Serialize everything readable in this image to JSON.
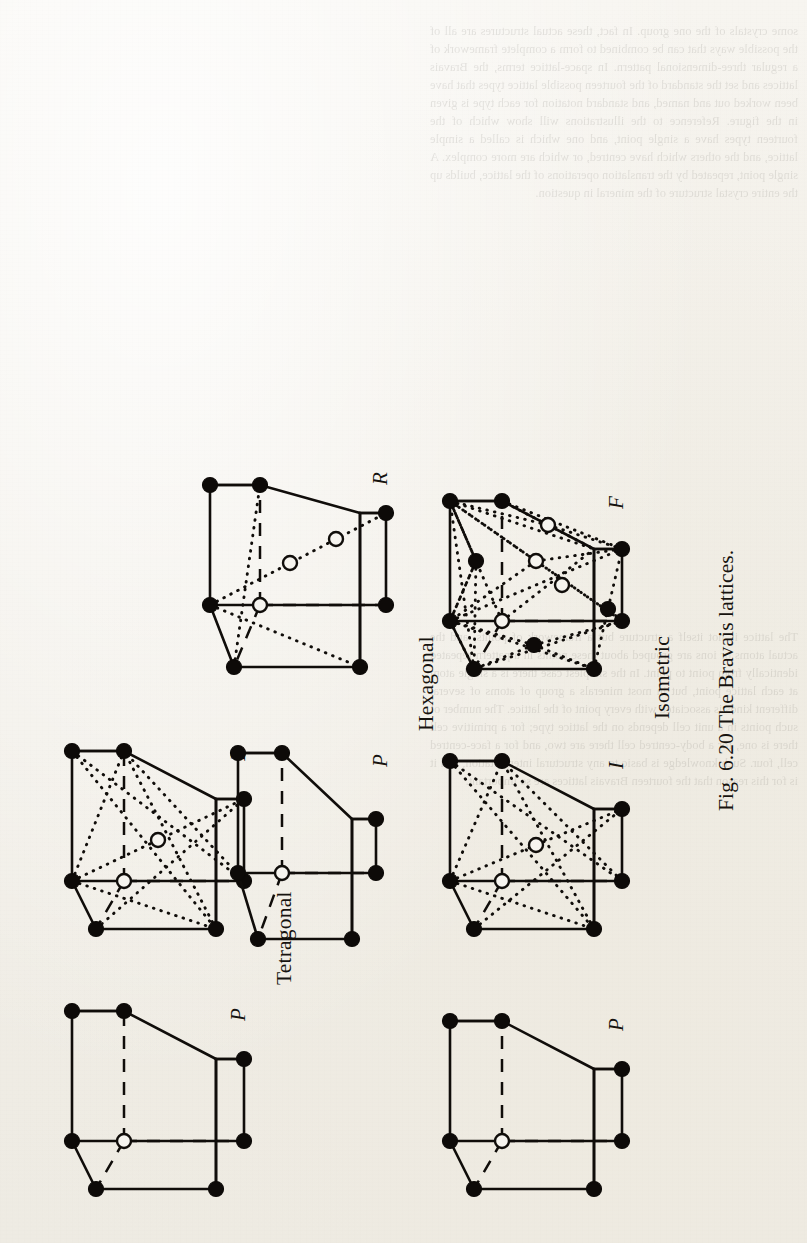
{
  "page": {
    "figure_caption": "Fig. 6.20   The Bravais lattices.",
    "background_color": "#f2efe8",
    "ink_color": "#100d0a",
    "rotation": "-90deg"
  },
  "figure": {
    "caption": "Fig. 6.20   The Bravais lattices.",
    "systems": [
      {
        "name": "Tetragonal",
        "cells": [
          {
            "symbol": "P"
          },
          {
            "symbol": "I"
          }
        ]
      },
      {
        "name": "Isometric",
        "cells": [
          {
            "symbol": "P"
          },
          {
            "symbol": "I"
          },
          {
            "symbol": "F"
          }
        ]
      },
      {
        "name": "Hexagonal",
        "cells": [
          {
            "symbol": "P"
          },
          {
            "symbol": "R"
          }
        ]
      }
    ],
    "cells": [
      {
        "id": "tetragonal-p",
        "system": "Tetragonal",
        "symbol": "P",
        "description": "primitive tetragonal prism, corner nodes filled, one hidden corner node open",
        "filled_nodes": 7,
        "open_nodes": 1
      },
      {
        "id": "tetragonal-i",
        "system": "Tetragonal",
        "symbol": "I",
        "description": "body-centred tetragonal prism with dotted body diagonals meeting at open centre node",
        "filled_nodes": 7,
        "open_nodes": 2
      },
      {
        "id": "isometric-p",
        "system": "Isometric",
        "symbol": "P",
        "description": "primitive cube, corner nodes filled, one hidden corner node open",
        "filled_nodes": 7,
        "open_nodes": 1
      },
      {
        "id": "isometric-i",
        "system": "Isometric",
        "symbol": "I",
        "description": "body-centred cube with dotted body diagonals meeting at open centre node",
        "filled_nodes": 7,
        "open_nodes": 2
      },
      {
        "id": "isometric-f",
        "system": "Isometric",
        "symbol": "F",
        "description": "face-centred cube with dotted face diagonals and nodes at each face centre",
        "filled_nodes": 10,
        "open_nodes": 4
      },
      {
        "id": "hexagonal-p",
        "system": "Hexagonal",
        "symbol": "P",
        "description": "primitive hexagonal (rhombic prism) cell, corner nodes filled, one hidden corner node open",
        "filled_nodes": 7,
        "open_nodes": 1
      },
      {
        "id": "hexagonal-r",
        "system": "Hexagonal",
        "symbol": "R",
        "description": "rhombohedral cell with two interior nodes on the dotted long body diagonal",
        "filled_nodes": 7,
        "open_nodes": 3
      }
    ],
    "labels": {
      "tetragonal": "Tetragonal",
      "isometric": "Isometric",
      "hexagonal": "Hexagonal",
      "p": "P",
      "i": "I",
      "f": "F",
      "r": "R"
    }
  },
  "bleed_through": {
    "visible": true,
    "note": "faint mirrored text showing through from the reverse side of the leaf",
    "top_block": "some crystals of the one group. In fact, these actual structures are all of the possible ways that can be combined to form a complete framework of a regular three-dimensional pattern. In space-lattice terms, the Bravais lattices and set the standard of the fourteen possible lattice types that have been worked out and named, and standard notation for each type is given in the figure. Reference to the illustrations will show which of the fourteen types have a single point, and one which is called a simple lattice, and the others which have centred, or which are more complex. A single point, repeated by the translation operations of the lattice, builds up the entire crystal structure of the mineral in question.",
    "bottom_block": "The lattice is not itself a structure but a framework of points, and the actual atoms or ions are grouped about these points in a pattern repeated identically from point to point. In the simplest case there is a single atom at each lattice point, but in most minerals a group of atoms of several different kinds is associated with every point of the lattice. The number of such points in a unit cell depends on the lattice type; for a primitive cell there is one, for a body-centred cell there are two, and for a face-centred cell, four. Such knowledge is basic to any structural interpretation, and it is for this reason that the fourteen Bravais lattices are so important."
  }
}
